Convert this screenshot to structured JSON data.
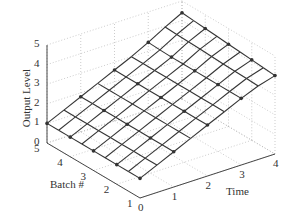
{
  "chart_data": {
    "type": "surface",
    "title": "",
    "xlabel": "Time",
    "ylabel": "Batch #",
    "zlabel": "Output Level",
    "x_ticks": [
      "0",
      "1",
      "2",
      "3",
      "4"
    ],
    "y_ticks": [
      "1",
      "2",
      "3",
      "4",
      "5"
    ],
    "z_ticks": [
      "0",
      "1",
      "2",
      "3",
      "4",
      "5"
    ],
    "xlim": [
      0,
      4
    ],
    "ylim": [
      1,
      5
    ],
    "zlim": [
      0,
      5
    ],
    "grid": true,
    "x": [
      0,
      0.5,
      1,
      1.5,
      2,
      2.5,
      3,
      3.5,
      4
    ],
    "y": [
      1,
      1.5,
      2,
      2.5,
      3,
      3.5,
      4,
      4.5,
      5
    ],
    "z_rows_by_batch": [
      [
        1.0,
        1.4,
        1.8,
        2.2,
        2.6,
        3.0,
        3.4,
        3.75,
        4.0
      ],
      [
        1.0,
        1.4,
        1.8,
        2.2,
        2.6,
        3.0,
        3.4,
        3.78,
        4.05
      ],
      [
        1.0,
        1.4,
        1.8,
        2.2,
        2.6,
        3.0,
        3.4,
        3.8,
        4.1
      ],
      [
        1.0,
        1.4,
        1.8,
        2.2,
        2.6,
        3.0,
        3.4,
        3.82,
        4.15
      ],
      [
        1.0,
        1.4,
        1.8,
        2.2,
        2.6,
        3.0,
        3.4,
        3.85,
        4.2
      ],
      [
        1.0,
        1.4,
        1.8,
        2.2,
        2.6,
        3.0,
        3.4,
        3.88,
        4.25
      ],
      [
        1.0,
        1.4,
        1.8,
        2.2,
        2.6,
        3.0,
        3.4,
        3.9,
        4.3
      ],
      [
        1.0,
        1.4,
        1.8,
        2.2,
        2.6,
        3.0,
        3.42,
        3.92,
        4.35
      ],
      [
        1.0,
        1.4,
        1.8,
        2.2,
        2.6,
        3.0,
        3.45,
        3.95,
        4.4
      ]
    ]
  },
  "labels": {
    "zlabel": "Output Level",
    "ylabel": "Batch #",
    "xlabel": "Time"
  },
  "colors": {
    "mesh": "#333333",
    "grid": "#aaaaaa",
    "axis": "#333333"
  }
}
